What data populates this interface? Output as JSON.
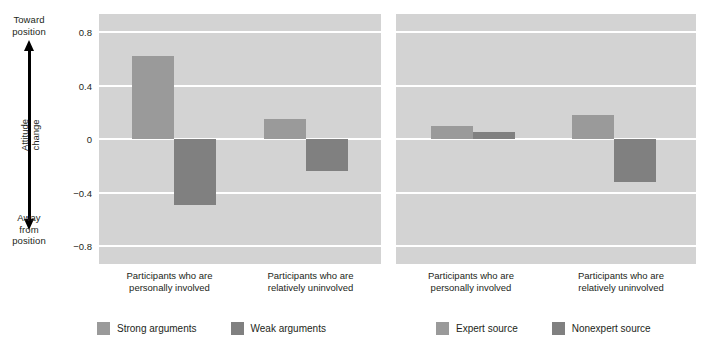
{
  "chart_data": [
    {
      "type": "bar",
      "title": "",
      "panel_name": "Argument quality",
      "xlabel": "",
      "ylabel": "Attitude change",
      "ylim": [
        -0.8,
        0.8
      ],
      "yticks": [
        "0.8",
        "0.4",
        "0",
        "−0.4",
        "−0.8"
      ],
      "ytick_values": [
        0.8,
        0.4,
        0,
        -0.4,
        -0.8
      ],
      "grid": true,
      "categories": [
        "Participants who are personally involved",
        "Participants who are relatively uninvolved"
      ],
      "series": [
        {
          "name": "Strong arguments",
          "color": "#9a9a9a",
          "values": [
            0.62,
            0.15
          ]
        },
        {
          "name": "Weak arguments",
          "color": "#808080",
          "values": [
            -0.49,
            -0.24
          ]
        }
      ],
      "legend_position": "bottom"
    },
    {
      "type": "bar",
      "title": "",
      "panel_name": "Source expertise",
      "xlabel": "",
      "ylabel": "Attitude change",
      "ylim": [
        -0.8,
        0.8
      ],
      "yticks": [
        "0.8",
        "0.4",
        "0",
        "−0.4",
        "−0.8"
      ],
      "ytick_values": [
        0.8,
        0.4,
        0,
        -0.4,
        -0.8
      ],
      "grid": true,
      "categories": [
        "Participants who are personally involved",
        "Participants who are relatively uninvolved"
      ],
      "series": [
        {
          "name": "Expert source",
          "color": "#9a9a9a",
          "values": [
            0.1,
            0.18
          ]
        },
        {
          "name": "Nonexpert source",
          "color": "#808080",
          "values": [
            0.05,
            -0.32
          ]
        }
      ],
      "legend_position": "bottom"
    }
  ],
  "yaxis": {
    "top_caption_line1": "Toward",
    "top_caption_line2": "position",
    "bottom_caption_line1": "Away",
    "bottom_caption_line2": "from",
    "bottom_caption_line3": "position",
    "title_line1": "Attitude",
    "title_line2": "change",
    "ticks": [
      "0.8",
      "0.4",
      "0",
      "−0.4",
      "−0.8"
    ]
  },
  "panels": [
    {
      "id": "arguments",
      "group_labels": [
        {
          "line1": "Participants who are",
          "line2": "personally involved"
        },
        {
          "line1": "Participants who are",
          "line2": "relatively uninvolved"
        }
      ],
      "legend": [
        {
          "label": "Strong arguments",
          "color": "#9a9a9a"
        },
        {
          "label": "Weak arguments",
          "color": "#808080"
        }
      ]
    },
    {
      "id": "source",
      "group_labels": [
        {
          "line1": "Participants who are",
          "line2": "personally involved"
        },
        {
          "line1": "Participants who are",
          "line2": "relatively uninvolved"
        }
      ],
      "legend": [
        {
          "label": "Expert source",
          "color": "#9a9a9a"
        },
        {
          "label": "Nonexpert source",
          "color": "#808080"
        }
      ]
    }
  ],
  "colors": {
    "panel_background": "#d3d3d3",
    "gridline": "#ffffff",
    "bar_light": "#9a9a9a",
    "bar_dark": "#808080",
    "text": "#231f20",
    "page_background": "#ffffff"
  }
}
